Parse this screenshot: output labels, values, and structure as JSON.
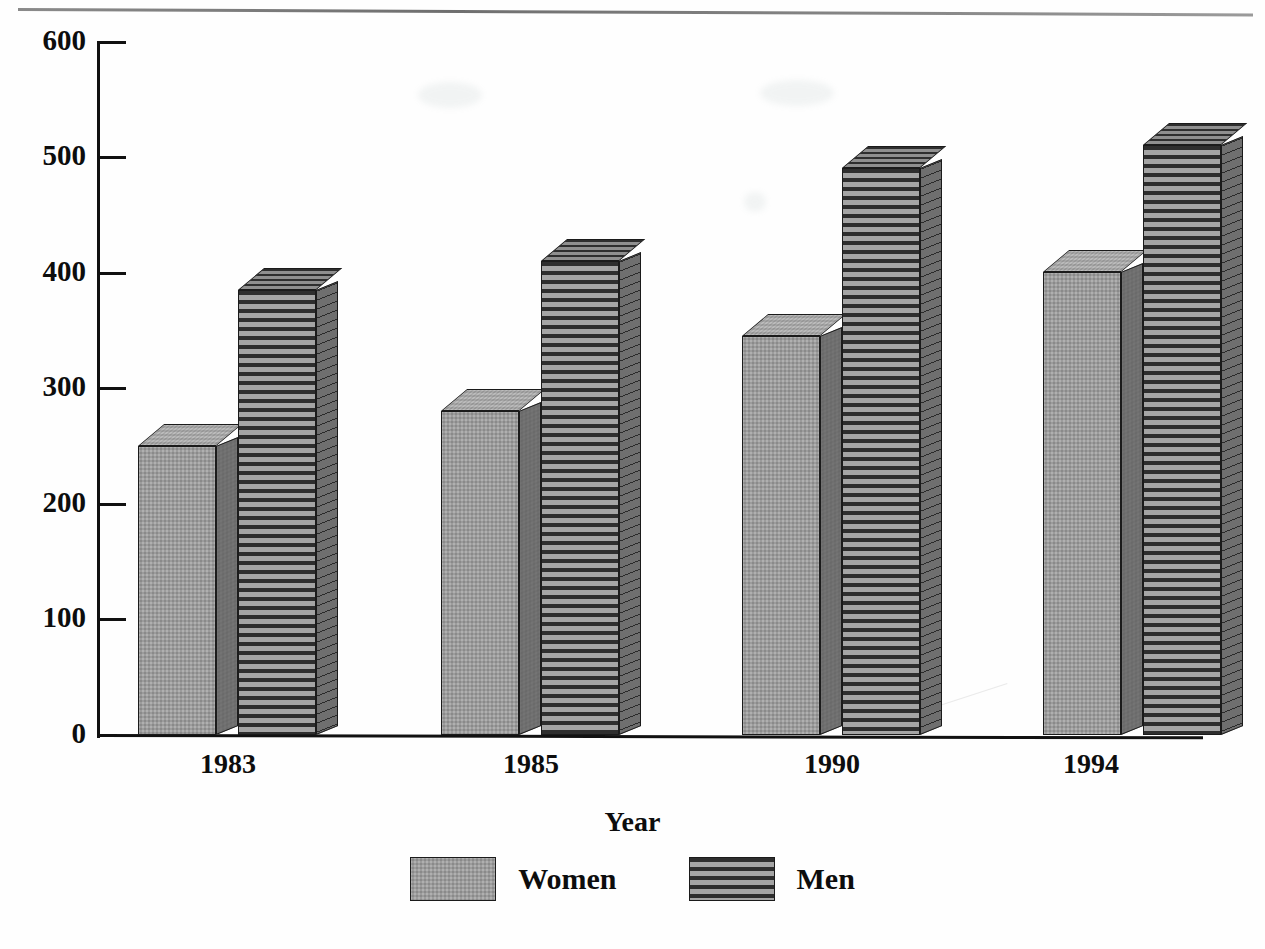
{
  "chart_data": {
    "type": "bar",
    "title": "",
    "subtitle": "",
    "xlabel": "Year",
    "ylabel": "",
    "categories": [
      "1983",
      "1985",
      "1990",
      "1994"
    ],
    "series": [
      {
        "name": "Women",
        "values": [
          250,
          280,
          345,
          400
        ]
      },
      {
        "name": "Men",
        "values": [
          385,
          410,
          490,
          510
        ]
      }
    ],
    "ylim": [
      0,
      600
    ],
    "yticks": [
      0,
      100,
      200,
      300,
      400,
      500,
      600
    ],
    "ytick_labels": [
      "0",
      "100",
      "200",
      "300",
      "400",
      "500",
      "600"
    ],
    "grid": false,
    "legend_position": "bottom",
    "style": "3d-bar",
    "colors": {
      "women_fill": "#9c9c9c",
      "women_side": "#6f6f6f",
      "women_top": "#a8a8a8",
      "men_stripe_dark": "#2e2e2e",
      "men_stripe_light": "#a5a5a5",
      "men_side": "#6f6f6f",
      "axis": "#111111",
      "background": "#ffffff"
    }
  },
  "legend": {
    "items": [
      {
        "label": "Women",
        "pattern": "stipple"
      },
      {
        "label": "Men",
        "pattern": "horizontal-stripes"
      }
    ]
  },
  "axis": {
    "x_title": "Year"
  }
}
